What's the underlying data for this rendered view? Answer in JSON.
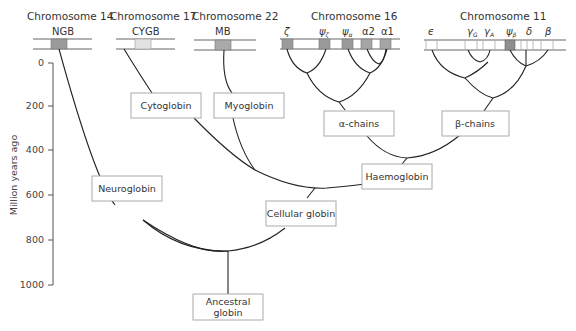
{
  "chromosomes": [
    {
      "title": "Chromosome 14",
      "genes": [
        {
          "label": "NGB",
          "color": "#9a9a9a"
        }
      ]
    },
    {
      "title": "Chromosome 17",
      "genes": [
        {
          "label": "CYGB",
          "color": "#e2e2e2"
        }
      ]
    },
    {
      "title": "Chromosome 22",
      "genes": [
        {
          "label": "MB",
          "color": "#aaaaaa"
        }
      ]
    },
    {
      "title": "Chromosome 16",
      "genes": [
        {
          "label": "ζ",
          "color": "#9a9a9a"
        },
        {
          "label": "ψζ",
          "color": "#9a9a9a"
        },
        {
          "label": "ψα",
          "color": "#9a9a9a"
        },
        {
          "label": "α2",
          "color": "#a5a5a5"
        },
        {
          "label": "α1",
          "color": "#a5a5a5"
        }
      ]
    },
    {
      "title": "Chromosome 11",
      "genes": [
        {
          "label": "ε",
          "color": "#ffffff"
        },
        {
          "label": "γG",
          "color": "#ffffff"
        },
        {
          "label": "γA",
          "color": "#ffffff"
        },
        {
          "label": "ψβ",
          "color": "#8f8f8f"
        },
        {
          "label": "δ",
          "color": "#ffffff"
        },
        {
          "label": "β",
          "color": "#ffffff"
        }
      ]
    }
  ],
  "axis": {
    "title": "Million years ago",
    "ticks": [
      "0",
      "200",
      "400",
      "600",
      "800",
      "1000"
    ]
  },
  "nodes": {
    "cytoglobin": "Cytoglobin",
    "myoglobin": "Myoglobin",
    "alpha_chains": "α-chains",
    "beta_chains": "β-chains",
    "neuroglobin": "Neuroglobin",
    "haemoglobin": "Haemoglobin",
    "cellular_globin": "Cellular globin",
    "ancestral_globin_line1": "Ancestral",
    "ancestral_globin_line2": "globin"
  },
  "gene_labels": {
    "zeta": "ζ",
    "psi": "ψ",
    "psi_zeta_sub": "ζ",
    "psi_alpha_sub": "α",
    "alpha2": "α2",
    "alpha1": "α1",
    "epsilon": "ϵ",
    "gamma": "γ",
    "gamma_G_sub": "G",
    "gamma_A_sub": "A",
    "psi_beta_sub": "β",
    "delta": "δ",
    "beta": "β",
    "ngb": "NGB",
    "cygb": "CYGB",
    "mb": "MB"
  },
  "colors": {
    "dark_gene": "#9a9a9a",
    "light_gene": "#e2e2e2",
    "branch": "#222222",
    "box_border": "#aaaaaa"
  }
}
